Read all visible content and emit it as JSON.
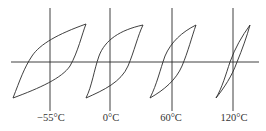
{
  "figure": {
    "line_color": "#2a2a2a",
    "loops": [
      {
        "label": "−55°C",
        "axis_x": 50
      },
      {
        "label": "0°C",
        "axis_x": 110
      },
      {
        "label": "60°C",
        "axis_x": 172
      },
      {
        "label": "120°C",
        "axis_x": 233
      }
    ]
  }
}
